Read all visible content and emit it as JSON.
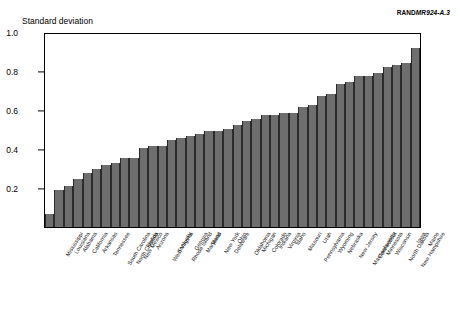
{
  "figure": {
    "credit_prefix": "RAND",
    "credit_code": "MR924-A.3",
    "axis_title": "Standard deviation"
  },
  "chart_data": {
    "type": "bar",
    "title": "",
    "subtitle": "",
    "xlabel": "",
    "ylabel": "Standard deviation",
    "ylim": [
      0,
      1.0
    ],
    "yticks": [
      "0.2",
      "0.4",
      "0.6",
      "0.8",
      "1.0"
    ],
    "ytick_values": [
      0.2,
      0.4,
      0.6,
      0.8,
      1.0
    ],
    "grid": false,
    "legend": "none",
    "bar_color": "#6e6e6e",
    "frame_color": "#000000",
    "categories": [
      "Mississippi",
      "Louisiana",
      "Alabama",
      "California",
      "Arkansas",
      "Tennessee",
      "South Carolina",
      "North Carolina",
      "New Mexico",
      "Florida",
      "Arizona",
      "West Virginia",
      "Kentucky",
      "Rhode Island",
      "Georgia",
      "Maryland",
      "Texas",
      "New York",
      "Delaware",
      "Ohio",
      "Oklahoma",
      "Michigan",
      "Colorado",
      "Indiana",
      "Virginia",
      "Idaho",
      "Missouri",
      "Pennsylvania",
      "Utah",
      "Wyoming",
      "Nebraska",
      "New Jersey",
      "Massachusetts",
      "Connecticut",
      "Minnesota",
      "Wisconsin",
      "North Dakota",
      "New Hampshire",
      "Iowa",
      "Maine"
    ],
    "values": [
      0.07,
      0.19,
      0.21,
      0.25,
      0.28,
      0.3,
      0.32,
      0.33,
      0.36,
      0.36,
      0.41,
      0.42,
      0.42,
      0.45,
      0.46,
      0.47,
      0.48,
      0.5,
      0.5,
      0.51,
      0.53,
      0.55,
      0.56,
      0.58,
      0.58,
      0.59,
      0.59,
      0.62,
      0.63,
      0.68,
      0.69,
      0.74,
      0.75,
      0.78,
      0.78,
      0.8,
      0.83,
      0.84,
      0.85,
      0.93
    ]
  }
}
